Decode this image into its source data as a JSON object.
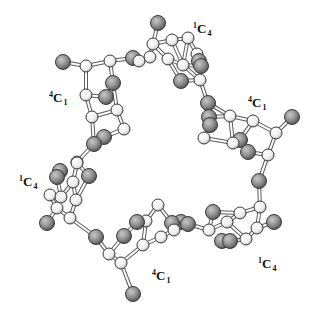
{
  "figure": {
    "colors": {
      "background": "#ffffff",
      "carbon_fill": "#f4f4f4",
      "oxygen_fill": "#8a8a8a",
      "atom_stroke": "#3a3a3a",
      "bond": "#555555"
    },
    "labels": [
      {
        "id": "unit-top-left",
        "sup": "4",
        "main": "C",
        "sub": "1",
        "x": 49,
        "y": 91
      },
      {
        "id": "unit-top",
        "sup": "1",
        "main": "C",
        "sub": "4",
        "x": 193,
        "y": 22
      },
      {
        "id": "unit-right",
        "sup": "4",
        "main": "C",
        "sub": "1",
        "x": 248,
        "y": 96
      },
      {
        "id": "unit-left",
        "sup": "1",
        "main": "C",
        "sub": "4",
        "x": 19,
        "y": 175
      },
      {
        "id": "unit-bottom-right",
        "sup": "1",
        "main": "C",
        "sub": "4",
        "x": 258,
        "y": 257
      },
      {
        "id": "unit-bottom",
        "sup": "4",
        "main": "C",
        "sub": "1",
        "x": 152,
        "y": 269
      }
    ]
  }
}
